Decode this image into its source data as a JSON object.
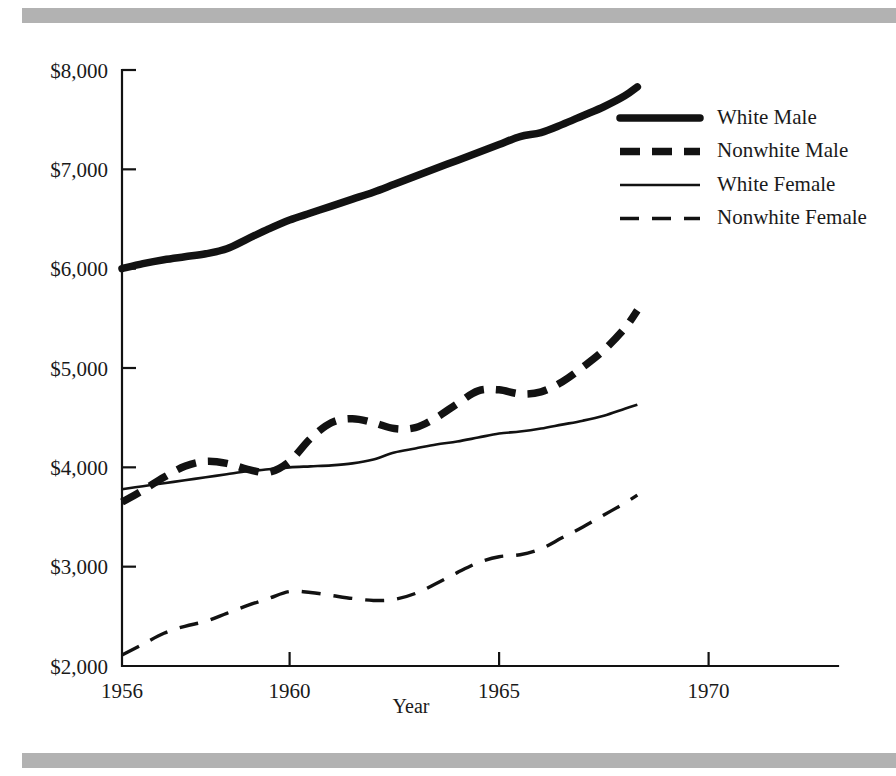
{
  "figure": {
    "decor": {
      "top_rule": "horizontal-rule",
      "bottom_rule": "horizontal-rule",
      "rule_color": "#b2b2b2"
    }
  },
  "chart_data": {
    "type": "line",
    "title": "",
    "subtitle": "",
    "xlabel": "Year",
    "ylabel": "",
    "xlim": [
      1956,
      1971.5
    ],
    "ylim": [
      2000,
      8000
    ],
    "grid": false,
    "legend_position": "upper-right",
    "x_ticks": [
      1956,
      1960,
      1965,
      1970
    ],
    "x_tick_labels": [
      "1956",
      "1960",
      "1965",
      "1970"
    ],
    "y_ticks": [
      2000,
      3000,
      4000,
      5000,
      6000,
      7000,
      8000
    ],
    "y_tick_labels": [
      "$2,000",
      "$3,000",
      "$4,000",
      "$5,000",
      "$6,000",
      "$7,000",
      "$8,000"
    ],
    "currency_symbol": "$",
    "line_color": "#121212",
    "series": [
      {
        "name": "White Male",
        "style": "thick-solid",
        "x": [
          1956,
          1956.5,
          1957,
          1957.5,
          1958,
          1958.5,
          1959,
          1959.5,
          1960,
          1960.5,
          1961,
          1961.5,
          1962,
          1962.5,
          1963,
          1963.5,
          1964,
          1964.5,
          1965,
          1965.5,
          1966,
          1966.5,
          1967,
          1967.5,
          1968,
          1968.3
        ],
        "y": [
          6000,
          6050,
          6090,
          6120,
          6150,
          6200,
          6300,
          6400,
          6490,
          6560,
          6630,
          6700,
          6770,
          6850,
          6930,
          7010,
          7090,
          7170,
          7250,
          7330,
          7370,
          7450,
          7540,
          7630,
          7740,
          7830
        ]
      },
      {
        "name": "Nonwhite Male",
        "style": "thick-dashed",
        "x": [
          1956,
          1956.5,
          1957,
          1957.5,
          1958,
          1958.5,
          1959,
          1959.5,
          1960,
          1960.5,
          1961,
          1961.5,
          1962,
          1962.5,
          1963,
          1963.5,
          1964,
          1964.5,
          1965,
          1965.5,
          1966,
          1966.5,
          1967,
          1967.5,
          1968,
          1968.3
        ],
        "y": [
          3650,
          3770,
          3900,
          4010,
          4060,
          4040,
          3980,
          3950,
          4060,
          4290,
          4450,
          4490,
          4450,
          4390,
          4400,
          4500,
          4640,
          4770,
          4780,
          4740,
          4760,
          4860,
          5010,
          5180,
          5400,
          5580
        ]
      },
      {
        "name": "White Female",
        "style": "thin-solid",
        "x": [
          1956,
          1956.5,
          1957,
          1957.5,
          1958,
          1958.5,
          1959,
          1959.5,
          1960,
          1960.5,
          1961,
          1961.5,
          1962,
          1962.5,
          1963,
          1963.5,
          1964,
          1964.5,
          1965,
          1965.5,
          1966,
          1966.5,
          1967,
          1967.5,
          1968,
          1968.3
        ],
        "y": [
          3780,
          3810,
          3840,
          3870,
          3900,
          3930,
          3960,
          3980,
          4000,
          4010,
          4020,
          4040,
          4080,
          4150,
          4190,
          4230,
          4260,
          4300,
          4340,
          4360,
          4390,
          4430,
          4470,
          4520,
          4590,
          4630
        ]
      },
      {
        "name": "Nonwhite Female",
        "style": "thin-dashed",
        "x": [
          1956,
          1956.5,
          1957,
          1957.5,
          1958,
          1958.5,
          1959,
          1959.5,
          1960,
          1960.5,
          1961,
          1961.5,
          1962,
          1962.5,
          1963,
          1963.5,
          1964,
          1964.5,
          1965,
          1965.5,
          1966,
          1966.5,
          1967,
          1967.5,
          1968,
          1968.3
        ],
        "y": [
          2110,
          2220,
          2330,
          2400,
          2450,
          2530,
          2610,
          2680,
          2750,
          2740,
          2710,
          2680,
          2660,
          2670,
          2730,
          2830,
          2940,
          3040,
          3100,
          3120,
          3180,
          3290,
          3400,
          3520,
          3640,
          3720
        ]
      }
    ],
    "legend": [
      {
        "label": "White Male",
        "style": "thick-solid"
      },
      {
        "label": "Nonwhite Male",
        "style": "thick-dashed"
      },
      {
        "label": "White Female",
        "style": "thin-solid"
      },
      {
        "label": "Nonwhite Female",
        "style": "thin-dashed"
      }
    ]
  }
}
